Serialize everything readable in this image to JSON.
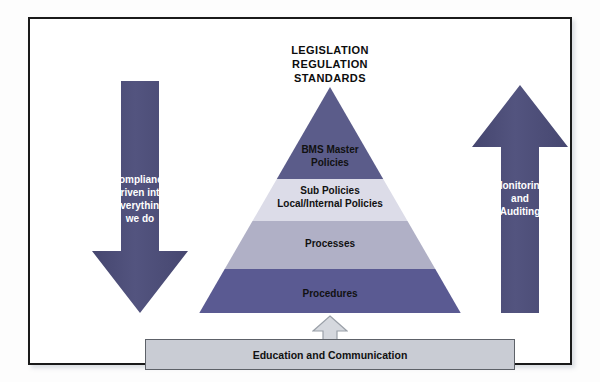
{
  "diagram": {
    "title_lines": [
      "LEGISLATION",
      "REGULATION",
      "STANDARDS"
    ],
    "colors": {
      "layer_dark_top": "#5b5c8a",
      "layer_light": "#dcdce8",
      "layer_medium": "#b0b0c6",
      "layer_dark_bottom": "#5a5a92",
      "arrow_fill": "#4e4f7c",
      "bar_fill": "#c9ccd4",
      "bar_border": "#5d6168",
      "connector_fill": "#d5d8de",
      "connector_border": "#9aa0a8",
      "frame_border": "#1a1a1a",
      "background": "#ffffff",
      "text_dark": "#111111",
      "text_light": "#ffffff"
    },
    "pyramid": {
      "layers": [
        {
          "label": "BMS Master Policies",
          "label_line1": "BMS Master",
          "label_line2": "Policies",
          "fill": "#5b5c8a",
          "text_color": "#111111"
        },
        {
          "label": "Sub Policies Local/Internal Policies",
          "label_line1": "Sub Policies",
          "label_line2": "Local/Internal Policies",
          "fill": "#dcdce8",
          "text_color": "#111111"
        },
        {
          "label": "Processes",
          "label_line1": "Processes",
          "label_line2": "",
          "fill": "#b0b0c6",
          "text_color": "#111111"
        },
        {
          "label": "Procedures",
          "label_line1": "Procedures",
          "label_line2": "",
          "fill": "#5a5a92",
          "text_color": "#111111"
        }
      ]
    },
    "left_arrow": {
      "direction": "down",
      "line1": "Compliance",
      "line2": "driven into",
      "line3": "everything",
      "line4": "we do"
    },
    "right_arrow": {
      "direction": "up",
      "line1": "Monitoring",
      "line2": "and",
      "line3": "Auditing"
    },
    "bottom_bar": {
      "label": "Education and Communication"
    },
    "connector": {
      "direction": "up"
    }
  }
}
